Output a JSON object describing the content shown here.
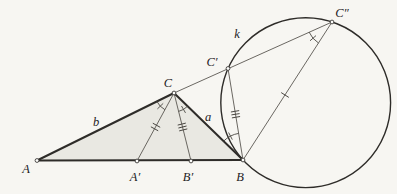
{
  "figure": {
    "colors": {
      "page_background": "#f7f6f2",
      "triangle_fill": "#e9e8e2",
      "main_stroke": "#2e2c29",
      "thin_stroke": "#5a5751",
      "label_text": "#23211e"
    },
    "labels": {
      "A": "A",
      "A_prime": "A′",
      "B_prime": "B′",
      "B": "B",
      "C": "C",
      "C_prime": "C′",
      "C_double_prime": "C″",
      "side_a": "a",
      "side_b": "b",
      "circle_k": "k"
    },
    "marked_points": [
      "A",
      "A′",
      "B′",
      "B",
      "C",
      "C′",
      "C″"
    ],
    "segment_tick_marks": {
      "C_to_A_prime": 2,
      "C_to_B_prime": 3,
      "C_prime_to_B": 3,
      "B_to_C_double_prime": 1
    },
    "angle_arc_marks": [
      "angle A-C-A′ at C",
      "angle B′-C-B at C",
      "angle C-B-C′ at B",
      "angle C′-C″-B at C″"
    ]
  }
}
